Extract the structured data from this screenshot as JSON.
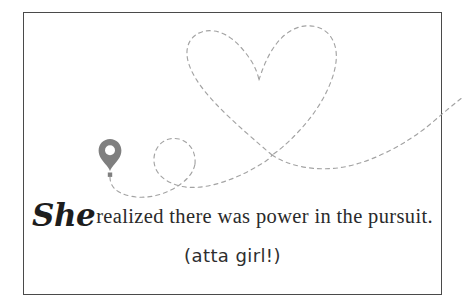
{
  "card": {
    "background_color": "#ffffff",
    "border_color": "#4a4a4a"
  },
  "artwork": {
    "path_color": "#a3a3a3",
    "path_style": "dashed",
    "marker_color": "#7f7f7f",
    "marker_icon": "map-pin-balloon-icon",
    "description": "dashed flight path looping into a heart shape"
  },
  "quote": {
    "script_word": "She",
    "body_text": "realized there was power in the pursuit.",
    "subtitle": "(atta girl!)"
  }
}
